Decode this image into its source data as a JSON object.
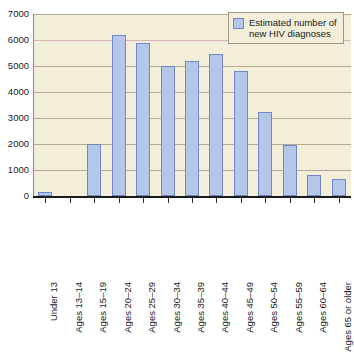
{
  "chart_data": {
    "type": "bar",
    "title": "",
    "xlabel": "",
    "ylabel": "",
    "ylim": [
      0,
      7000
    ],
    "ytick_step": 1000,
    "grid": true,
    "legend_position": "top-right",
    "categories": [
      "Under 13",
      "Ages 13–14",
      "Ages 15–19",
      "Ages 20–24",
      "Ages 25–29",
      "Ages 30–34",
      "Ages 35–39",
      "Ages 40–44",
      "Ages 45–49",
      "Ages 50–54",
      "Ages 55–59",
      "Ages 60–64",
      "Ages 65 or older"
    ],
    "values": [
      150,
      0,
      2000,
      6200,
      5900,
      5000,
      5180,
      5450,
      4800,
      3250,
      1950,
      820,
      640
    ],
    "series": [
      {
        "name": "Estimated number of new HIV diagnoses",
        "values": [
          150,
          0,
          2000,
          6200,
          5900,
          5000,
          5180,
          5450,
          4800,
          3250,
          1950,
          820,
          640
        ]
      }
    ],
    "ytick_labels": [
      "7000",
      "6000",
      "5000",
      "4000",
      "3000",
      "2000",
      "1000",
      "0"
    ],
    "colors": {
      "bar_fill": "#b5c7e8",
      "bar_border": "#6f87c4",
      "plot_background": "#f2eed9",
      "gridline": "#b0ab92",
      "gridline_accent": "#d6b3b8",
      "axis": "#1a1a1a",
      "page_background": "#ffffff"
    }
  },
  "legend": {
    "label": "Estimated number of\nnew HIV diagnoses",
    "swatch_color": "#b5c7e8"
  }
}
